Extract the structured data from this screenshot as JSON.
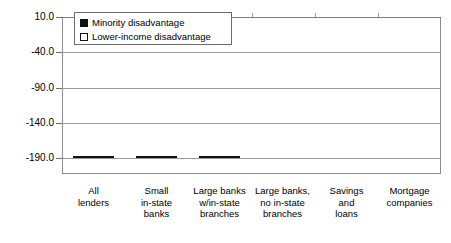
{
  "chart_data": {
    "type": "bar",
    "title": "",
    "subtitle": "",
    "xlabel": "",
    "ylabel": "",
    "grid": true,
    "legend_position": "top-left-inside",
    "axis_inverted": true,
    "ylim": [
      10.0,
      -190.0
    ],
    "yticks": [
      -190.0,
      -140.0,
      -90.0,
      -40.0,
      10.0
    ],
    "ytick_labels": [
      "-190.0",
      "-140.0",
      "-90.0",
      "-40.0",
      "10.0"
    ],
    "categories": [
      "All lenders",
      "Small in-state banks",
      "Large banks w/in-state branches",
      "Large banks, no in-state branches",
      "Savings and loans",
      "Mortgage companies"
    ],
    "category_lines": [
      [
        "All",
        "lenders"
      ],
      [
        "Small",
        "in-state",
        "banks"
      ],
      [
        "Large banks",
        "w/in-state",
        "branches"
      ],
      [
        "Large banks,",
        "no in-state",
        "branches"
      ],
      [
        "Savings",
        "and",
        "loans"
      ],
      [
        "Mortgage",
        "companies"
      ]
    ],
    "series": [
      {
        "name": "Minority disadvantage",
        "color": "#111111",
        "values": [
          -85.0,
          -135.0,
          -118.0,
          -185.0,
          -163.0,
          -5.0
        ]
      },
      {
        "name": "Lower-income disadvantage",
        "color": "#ffffff",
        "values": [
          -12.0,
          -13.0,
          -26.0,
          0.0,
          0.0,
          0.0
        ]
      }
    ]
  },
  "legend": {
    "items": [
      {
        "label": "Minority disadvantage",
        "swatch": "filled-square"
      },
      {
        "label": "Lower-income disadvantage",
        "swatch": "open-square"
      }
    ]
  },
  "colors": {
    "minority": "#111111",
    "lower_income": "#ffffff",
    "outline": "#111111",
    "grid": "#9a9a9a",
    "frame": "#8d8d8d",
    "background": "#ffffff"
  }
}
